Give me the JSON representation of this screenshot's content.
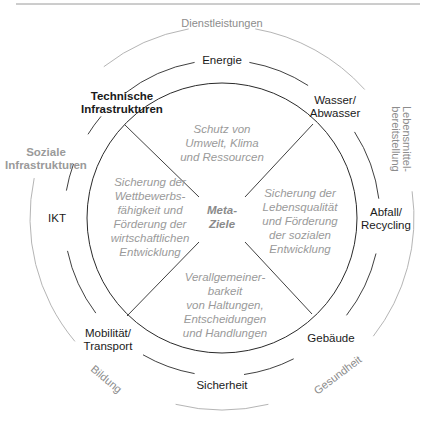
{
  "header": {
    "rule_color": "#9a9a9a"
  },
  "outer_ring": {
    "labels": {
      "top": "Dienstleistungen",
      "right": [
        "Lebensmittel-",
        "bereitstellung"
      ],
      "bottom_left": "Bildung",
      "bottom_right": "Gesundheit"
    }
  },
  "middle_ring": {
    "left_group": [
      "Soziale",
      "Infrastrukturen"
    ],
    "items": {
      "energie": [
        "Energie"
      ],
      "wasser": [
        "Wasser/",
        "Abwasser"
      ],
      "abfall": [
        "Abfall/",
        "Recycling"
      ],
      "gebaeude": [
        "Gebäude"
      ],
      "sicherheit": [
        "Sicherheit"
      ],
      "mobilitaet": [
        "Mobilität/",
        "Transport"
      ],
      "ikt": [
        "IKT"
      ]
    },
    "technical_group": [
      "Technische",
      "Infrastrukturen"
    ]
  },
  "inner_circle": {
    "center": [
      "Meta-",
      "Ziele"
    ],
    "goals": {
      "top": [
        "Schutz von",
        "Umwelt, Klima",
        "und Ressourcen"
      ],
      "left": [
        "Sicherung der",
        "Wettbewerbs-",
        "fähigkeit und",
        "Förderung der",
        "wirtschaftlichen",
        "Entwicklung"
      ],
      "right": [
        "Sicherung der",
        "Lebensqualität",
        "und Förderung",
        "der sozialen",
        "Entwicklung"
      ],
      "bottom": [
        "Verallgemeiner-",
        "barkeit",
        "von Haltungen,",
        "Entscheidungen",
        "und Handlungen"
      ]
    }
  },
  "colors": {
    "dark_line": "#2a2a2a",
    "light_line": "#b5b5b5",
    "grey_text": "#9a9a9a"
  }
}
